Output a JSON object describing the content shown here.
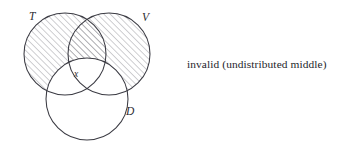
{
  "figure": {
    "kind": "venn-diagram",
    "background_color": "#ffffff",
    "stroke_color": "#3b3b43",
    "hatch_color": "#8d8d95",
    "label_color": "#2d2d33",
    "circles": [
      {
        "id": "T",
        "label": "T",
        "cx": 65,
        "cy": 54,
        "r": 41,
        "shaded": true,
        "label_x": 29,
        "label_y": 20
      },
      {
        "id": "V",
        "label": "V",
        "cx": 109,
        "cy": 54,
        "r": 41,
        "shaded": true,
        "label_x": 142,
        "label_y": 21
      },
      {
        "id": "D",
        "label": "D",
        "cx": 87,
        "cy": 99,
        "r": 41,
        "shaded": false,
        "label_x": 126,
        "label_y": 115
      }
    ],
    "markers": [
      {
        "id": "x",
        "label": "x",
        "x": 74,
        "y": 77
      }
    ],
    "shading_style": "diagonal-hatch",
    "hatch_spacing_px": 4.5,
    "hatch_direction": "up-right"
  },
  "caption": {
    "text": "invalid (undistributed middle)",
    "verdict": "invalid",
    "fallacy": "undistributed middle"
  }
}
